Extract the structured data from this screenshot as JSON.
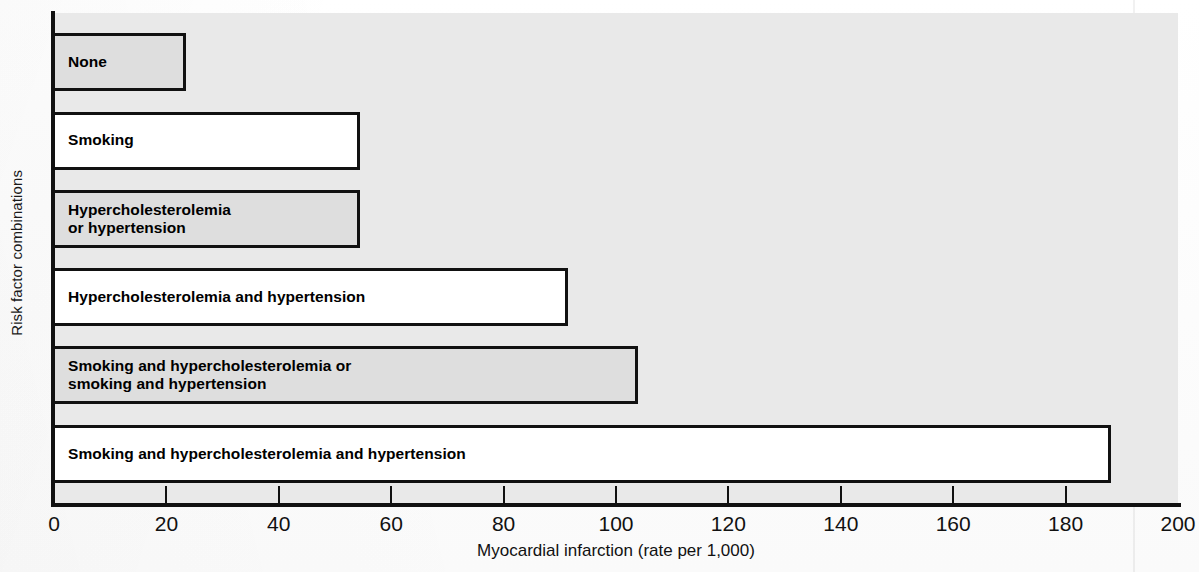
{
  "chart_data": {
    "type": "bar",
    "orientation": "horizontal",
    "title": "",
    "xlabel": "Myocardial infarction (rate per 1,000)",
    "ylabel": "Risk factor combinations",
    "xlim": [
      0,
      200
    ],
    "xticks": [
      0,
      20,
      40,
      60,
      80,
      100,
      120,
      140,
      160,
      180,
      200
    ],
    "xtick_labels": [
      "0",
      "20",
      "40",
      "60",
      "80",
      "100",
      "120",
      "140",
      "160",
      "180",
      "200"
    ],
    "grid": false,
    "legend": "none",
    "categories": [
      "None",
      "Smoking",
      "Hypercholesterolemia\nor hypertension",
      "Hypercholesterolemia and hypertension",
      "Smoking and hypercholesterolemia or\nsmoking and hypertension",
      "Smoking and hypercholesterolemia and hypertension"
    ],
    "values": [
      23.5,
      54.5,
      54.5,
      91.5,
      104,
      188
    ],
    "bar_fills": [
      "gray",
      "white",
      "gray",
      "white",
      "gray",
      "white"
    ],
    "colors": {
      "bar_gray": "#dedede",
      "bar_white": "#ffffff",
      "bar_outline": "#111111",
      "plot_background": "#e9e9e9",
      "axis": "#111111",
      "text": "#111111"
    }
  }
}
